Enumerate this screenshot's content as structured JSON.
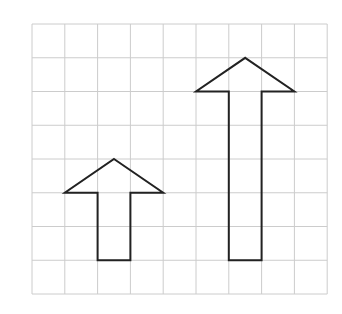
{
  "grid": {
    "columns": 9,
    "rows": 8,
    "origin_x": 32,
    "origin_y": 24,
    "cell_width": 32.8,
    "cell_height": 33.75,
    "line_color": "#cccccc",
    "line_width": 1
  },
  "shapes": [
    {
      "name": "small-arrow",
      "description": "Upward arrow, shaft 1 cell wide and 2 cells tall, head 3 cells wide and 1 cell tall",
      "points_grid": [
        [
          2.5,
          4
        ],
        [
          4,
          5
        ],
        [
          3,
          5
        ],
        [
          3,
          7
        ],
        [
          2,
          7
        ],
        [
          2,
          5
        ],
        [
          1,
          5
        ]
      ],
      "stroke": "#222222",
      "stroke_width": 2
    },
    {
      "name": "tall-arrow",
      "description": "Upward arrow, shaft 1 cell wide and 5 cells tall, head 3 cells wide and 1 cell tall",
      "points_grid": [
        [
          6.5,
          1
        ],
        [
          8,
          2
        ],
        [
          7,
          2
        ],
        [
          7,
          7
        ],
        [
          6,
          7
        ],
        [
          6,
          2
        ],
        [
          5,
          2
        ]
      ],
      "stroke": "#222222",
      "stroke_width": 2
    }
  ]
}
